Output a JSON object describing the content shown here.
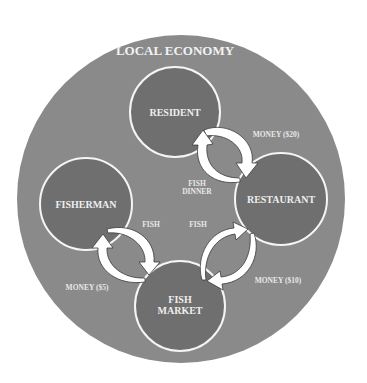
{
  "diagram": {
    "title": "LOCAL ECONOMY",
    "colors": {
      "background": "#ffffff",
      "economy_circle": "#8a8a8a",
      "node_fill": "#6f6f6f",
      "node_border": "#f5f5f5",
      "arrow_fill": "#ffffff",
      "text": "#eeeeee"
    },
    "nodes": [
      {
        "id": "resident",
        "label": "RESIDENT"
      },
      {
        "id": "restaurant",
        "label": "RESTAURANT"
      },
      {
        "id": "fisherman",
        "label": "FISHERMAN"
      },
      {
        "id": "fish_market",
        "label_line1": "FISH",
        "label_line2": "MARKET"
      }
    ],
    "flows": [
      {
        "from": "resident",
        "to": "restaurant",
        "label": "MONEY ($20)"
      },
      {
        "from": "restaurant",
        "to": "resident",
        "label_line1": "FISH",
        "label_line2": "DINNER"
      },
      {
        "from": "fisherman",
        "to": "fish_market",
        "label": "FISH"
      },
      {
        "from": "fish_market",
        "to": "fisherman",
        "label": "MONEY ($5)"
      },
      {
        "from": "fish_market",
        "to": "restaurant",
        "label": "FISH"
      },
      {
        "from": "restaurant",
        "to": "fish_market",
        "label": "MONEY ($10)"
      }
    ]
  }
}
